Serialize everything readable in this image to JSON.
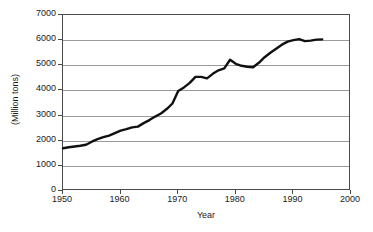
{
  "chart_data": {
    "type": "line",
    "title": "",
    "subtitle": "",
    "xlabel": "Year",
    "ylabel": "(Million tons)",
    "xlim": [
      1950,
      2000
    ],
    "ylim": [
      0,
      7000
    ],
    "grid": true,
    "legend": null,
    "xticks": [
      1950,
      1960,
      1970,
      1980,
      1990,
      2000
    ],
    "xtick_labels": [
      "1950",
      "1960",
      "1970",
      "1980",
      "1990",
      "2000"
    ],
    "yticks": [
      0,
      1000,
      2000,
      3000,
      4000,
      5000,
      6000,
      7000
    ],
    "ytick_labels": [
      "0",
      "1000",
      "2000",
      "3000",
      "4000",
      "5000",
      "6000",
      "7000"
    ],
    "line_color": "#111111",
    "line_width": 2.4,
    "series": [
      {
        "name": "Production",
        "x": [
          1950,
          1951,
          1952,
          1953,
          1954,
          1955,
          1956,
          1957,
          1958,
          1959,
          1960,
          1961,
          1962,
          1963,
          1964,
          1965,
          1966,
          1967,
          1968,
          1969,
          1970,
          1971,
          1972,
          1973,
          1974,
          1975,
          1976,
          1977,
          1978,
          1979,
          1980,
          1981,
          1982,
          1983,
          1984,
          1985,
          1986,
          1987,
          1988,
          1989,
          1990,
          1991,
          1992,
          1993,
          1994,
          1995
        ],
        "values": [
          1700,
          1740,
          1770,
          1800,
          1840,
          1960,
          2060,
          2140,
          2200,
          2300,
          2400,
          2460,
          2530,
          2560,
          2700,
          2820,
          2960,
          3080,
          3260,
          3480,
          3980,
          4120,
          4300,
          4540,
          4540,
          4480,
          4660,
          4800,
          4880,
          5220,
          5060,
          4980,
          4940,
          4920,
          5100,
          5320,
          5500,
          5660,
          5820,
          5940,
          6000,
          6040,
          5960,
          5980,
          6020,
          6030
        ]
      }
    ]
  },
  "axes": {
    "x_title": "Year",
    "y_title": "(Million tons)"
  }
}
